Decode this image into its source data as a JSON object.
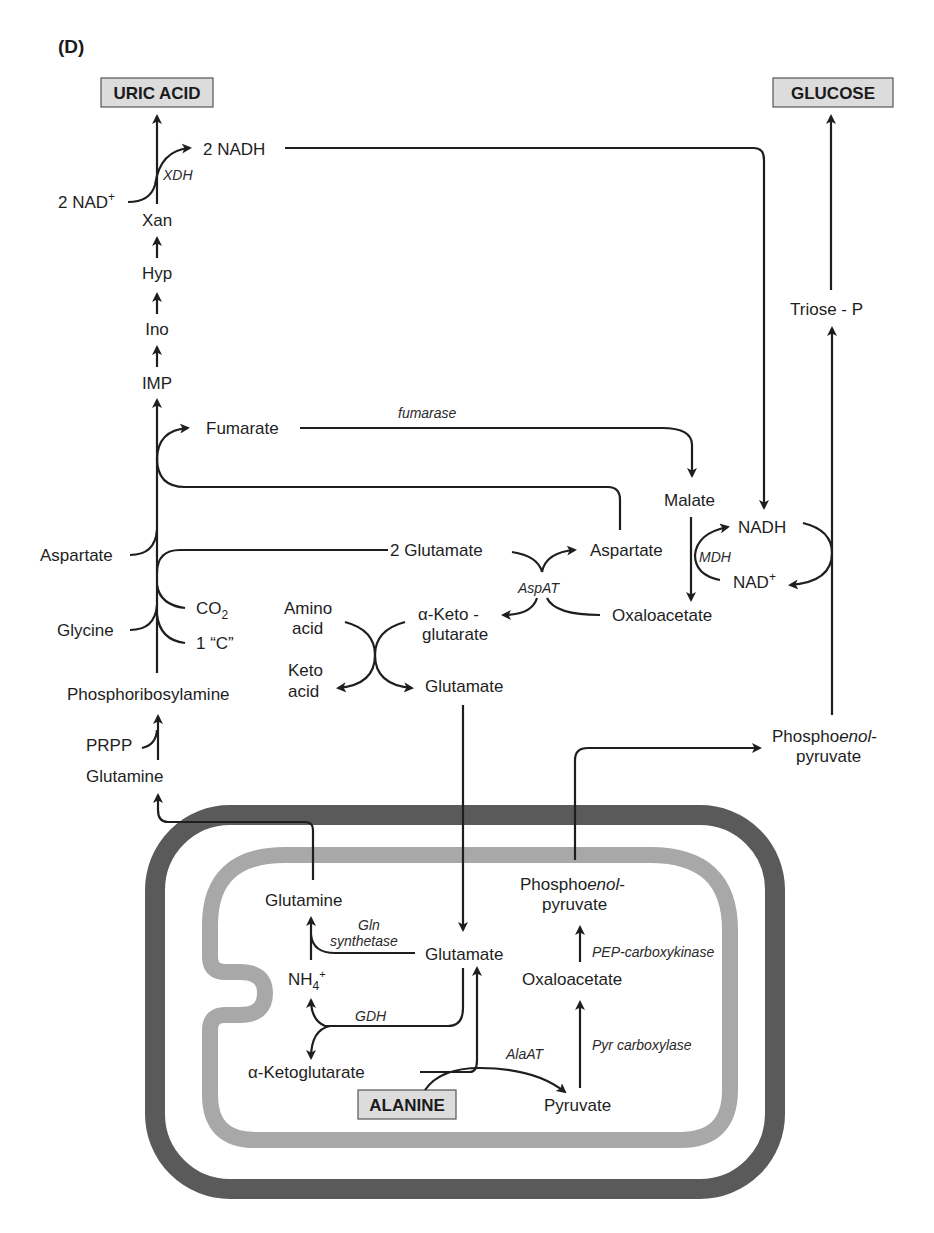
{
  "panel_label": "(D)",
  "end_products": {
    "uric_acid": "URIC ACID",
    "glucose": "GLUCOSE",
    "alanine": "ALANINE"
  },
  "purine_pathway": {
    "xan": "Xan",
    "hyp": "Hyp",
    "ino": "Ino",
    "imp": "IMP",
    "nad_plus_2": "2 NAD",
    "nad_plus_sup": "+",
    "nadh_2": "2 NADH",
    "xdh": "XDH",
    "fumarate": "Fumarate",
    "aspartate": "Aspartate",
    "glycine": "Glycine",
    "co2": "CO",
    "co2_sub": "2",
    "one_c": "1 “C”",
    "phosphoribosylamine": "Phosphoribosylamine",
    "prpp": "PRPP",
    "glutamine": "Glutamine"
  },
  "transamination": {
    "fumarase": "fumarase",
    "two_glutamate": "2 Glutamate",
    "aspartate": "Aspartate",
    "aspat": "AspAT",
    "alpha_keto_1": "α-Keto -",
    "alpha_keto_2": "glutarate",
    "oxaloacetate": "Oxaloacetate",
    "amino_acid_1": "Amino",
    "amino_acid_2": "acid",
    "keto_acid_1": "Keto",
    "keto_acid_2": "acid",
    "glutamate": "Glutamate"
  },
  "malate_shuttle": {
    "malate": "Malate",
    "nadh": "NADH",
    "mdh": "MDH",
    "nad_plus": "NAD",
    "nad_plus_sup": "+"
  },
  "gluconeogenesis": {
    "triose_p": "Triose - P",
    "pep_1a": "Phospho",
    "pep_1b": "enol",
    "pep_1c": "-",
    "pep_2": "pyruvate"
  },
  "cell": {
    "glutamine": "Glutamine",
    "gln_synthetase_1": "Gln",
    "gln_synthetase_2": "synthetase",
    "glutamate": "Glutamate",
    "nh4": "NH",
    "nh4_sub": "4",
    "nh4_sup": "+",
    "gdh": "GDH",
    "alpha_ketoglutarate": "α-Ketoglutarate",
    "alaat": "AlaAT",
    "pyruvate": "Pyruvate",
    "pyr_carboxylase": "Pyr carboxylase",
    "oxaloacetate": "Oxaloacetate",
    "pep_carboxykinase": "PEP-carboxykinase",
    "pep_1a": "Phospho",
    "pep_1b": "enol",
    "pep_1c": "-",
    "pep_2": "pyruvate"
  },
  "colors": {
    "outer_membrane": "#5a5a5a",
    "inner_membrane": "#a8a8a8",
    "box_fill": "#dcdcdc",
    "line": "#1e1e1e"
  }
}
